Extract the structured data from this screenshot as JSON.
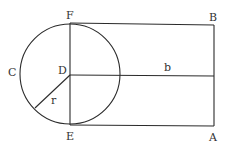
{
  "diagram": {
    "stroke_color": "#2b2b2b",
    "label_color": "#333333",
    "circle": {
      "center_label": "D",
      "cx": 70,
      "cy": 74,
      "r": 50
    },
    "labels": {
      "F": "F",
      "B": "B",
      "C": "C",
      "D": "D",
      "b": "b",
      "r": "r",
      "E": "E",
      "A": "A"
    },
    "points": {
      "F": [
        70,
        23
      ],
      "B": [
        214,
        25
      ],
      "E": [
        70,
        125
      ],
      "A": [
        214,
        126
      ],
      "D": [
        70,
        75
      ],
      "b_end": [
        214,
        76
      ],
      "r_end": [
        35,
        108
      ]
    }
  }
}
